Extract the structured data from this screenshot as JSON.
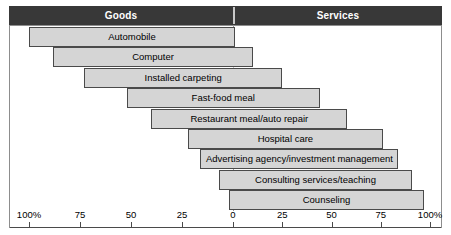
{
  "header": {
    "left_label": "Goods",
    "right_label": "Services"
  },
  "chart_data": {
    "type": "bar",
    "title": "",
    "subtitle": "",
    "xlabel": "",
    "ylabel": "",
    "orientation": "horizontal",
    "grid": false,
    "legend": null,
    "axis": {
      "center_value": 0,
      "left_max": 100,
      "right_max": 100,
      "tick_labels": [
        "100%",
        "75",
        "50",
        "25",
        "0",
        "25",
        "50",
        "75",
        "100%"
      ],
      "tick_values": [
        -100,
        -75,
        -50,
        -25,
        0,
        25,
        50,
        75,
        100
      ],
      "zero_line": "dashed"
    },
    "categories": [
      "Automobile",
      "Computer",
      "Installed carpeting",
      "Fast-food meal",
      "Restaurant meal/auto repair",
      "Hospital care",
      "Advertising agency/investment management",
      "Consulting services/teaching",
      "Counseling"
    ],
    "bars": [
      {
        "label": "Automobile",
        "start": -100,
        "end": 1
      },
      {
        "label": "Computer",
        "start": -88,
        "end": 10
      },
      {
        "label": "Installed carpeting",
        "start": -73,
        "end": 25
      },
      {
        "label": "Fast-food meal",
        "start": -52,
        "end": 44
      },
      {
        "label": "Restaurant meal/auto repair",
        "start": -40,
        "end": 58
      },
      {
        "label": "Hospital care",
        "start": -22,
        "end": 76
      },
      {
        "label": "Advertising agency/investment management",
        "start": -16,
        "end": 84
      },
      {
        "label": "Consulting services/teaching",
        "start": -7,
        "end": 91
      },
      {
        "label": "Counseling",
        "start": -2,
        "end": 97
      }
    ],
    "colors": {
      "bar_fill": "#d5d5d5",
      "bar_border": "#4a4a4a",
      "header_background": "#383838",
      "header_text": "#ffffff",
      "frame_border": "#8d8d8d",
      "axis": "#4a4a4a",
      "zero_line": "#9a9a9a",
      "background": "#ffffff"
    }
  }
}
